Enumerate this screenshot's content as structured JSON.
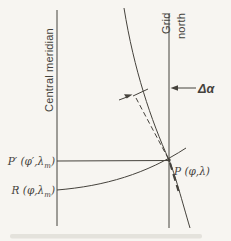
{
  "colors": {
    "background": "#f7f5f1",
    "ink": "#45423c"
  },
  "axes": {
    "central_meridian_label": "Central meridian",
    "grid_north_line1": "Grid",
    "grid_north_line2": "north"
  },
  "angle": {
    "delta_alpha_label": "Δα"
  },
  "points": {
    "p_prime": {
      "pre": "P′ (φ′,λ",
      "sub": "m",
      "post": ")"
    },
    "r": {
      "pre": "R (φ,λ",
      "sub": "m",
      "post": ")"
    },
    "p": {
      "label": "P (φ,λ)"
    }
  }
}
